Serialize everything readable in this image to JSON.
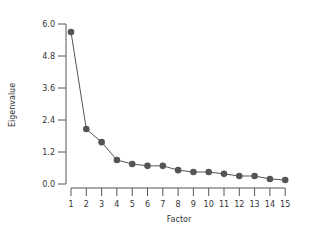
{
  "chart_data": {
    "type": "line",
    "title": "",
    "xlabel": "Factor",
    "ylabel": "Eigenvalue",
    "x": [
      1,
      2,
      3,
      4,
      5,
      6,
      7,
      8,
      9,
      10,
      11,
      12,
      13,
      14,
      15
    ],
    "series": [
      {
        "name": "Eigenvalue",
        "values": [
          5.7,
          2.06,
          1.57,
          0.9,
          0.75,
          0.68,
          0.68,
          0.52,
          0.45,
          0.45,
          0.38,
          0.3,
          0.3,
          0.19,
          0.15
        ]
      }
    ],
    "yticks": [
      "0.0",
      "1.2",
      "2.4",
      "3.6",
      "4.8",
      "6.0"
    ],
    "xticks": [
      "1",
      "2",
      "3",
      "4",
      "5",
      "6",
      "7",
      "8",
      "9",
      "10",
      "11",
      "12",
      "13",
      "14",
      "15"
    ],
    "ylim": [
      0,
      6.0
    ],
    "xlim": [
      1,
      15
    ],
    "grid": false,
    "legend": "none",
    "colors": {
      "line": "#555555",
      "marker": "#555555",
      "axis": "#555555"
    }
  }
}
